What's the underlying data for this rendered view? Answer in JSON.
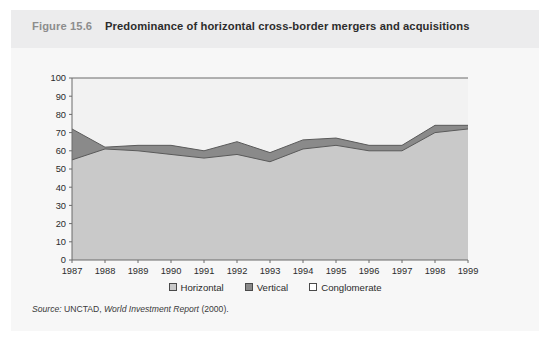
{
  "figure": {
    "number": "Figure 15.6",
    "title": "Predominance of horizontal cross-border mergers and acquisitions",
    "source_prefix": "Source:",
    "source_org": "UNCTAD,",
    "source_pub": "World Investment Report",
    "source_year": "(2000)."
  },
  "legend": {
    "position": "bottom-center",
    "items": [
      {
        "label": "Horizontal",
        "color": "#c9c9c9",
        "border": "#4a4a4a"
      },
      {
        "label": "Vertical",
        "color": "#8a8a8a",
        "border": "#4a4a4a"
      },
      {
        "label": "Conglomerate",
        "color": "#ffffff",
        "border": "#4a4a4a"
      }
    ]
  },
  "colors": {
    "panel": "#f7f7f7",
    "header_band": "#ececed",
    "plot_background": "#f2f2f2",
    "horizontal_fill": "#c9c9c9",
    "vertical_fill": "#8a8a8a",
    "conglomerate_fill": "#f2f2f2",
    "axis": "#6b6b6b",
    "series_outline": "#5a5a5a"
  },
  "chart_data": {
    "type": "area",
    "stacked": true,
    "title": "Predominance of horizontal cross-border mergers and acquisitions",
    "xlabel": "",
    "ylabel": "",
    "grid": false,
    "xlim": [
      1987,
      1999
    ],
    "ylim": [
      0,
      100
    ],
    "ytick_step": 10,
    "yticks": [
      0,
      10,
      20,
      30,
      40,
      50,
      60,
      70,
      80,
      90,
      100
    ],
    "categories": [
      1987,
      1988,
      1989,
      1990,
      1991,
      1992,
      1993,
      1994,
      1995,
      1996,
      1997,
      1998,
      1999
    ],
    "xtick_labels": [
      "1987",
      "1988",
      "1989",
      "1990",
      "1991",
      "1992",
      "1993",
      "1994",
      "1995",
      "1996",
      "1997",
      "1998",
      "1999"
    ],
    "series": [
      {
        "name": "Horizontal",
        "color": "#c9c9c9",
        "values": [
          55,
          61,
          60,
          58,
          56,
          58,
          54,
          61,
          63,
          60,
          60,
          70,
          72
        ]
      },
      {
        "name": "Vertical",
        "color": "#8a8a8a",
        "values": [
          17,
          1,
          3,
          5,
          4,
          7,
          5,
          5,
          4,
          3,
          3,
          4,
          2
        ]
      },
      {
        "name": "Conglomerate",
        "color": "#f2f2f2",
        "values": [
          28,
          38,
          37,
          37,
          40,
          35,
          41,
          34,
          33,
          37,
          37,
          26,
          26
        ]
      }
    ],
    "cumulative_upper_horizontal": [
      55,
      61,
      60,
      58,
      56,
      58,
      54,
      61,
      63,
      60,
      60,
      70,
      72
    ],
    "cumulative_upper_vertical": [
      72,
      62,
      63,
      63,
      60,
      65,
      59,
      66,
      67,
      63,
      63,
      74,
      74
    ]
  }
}
